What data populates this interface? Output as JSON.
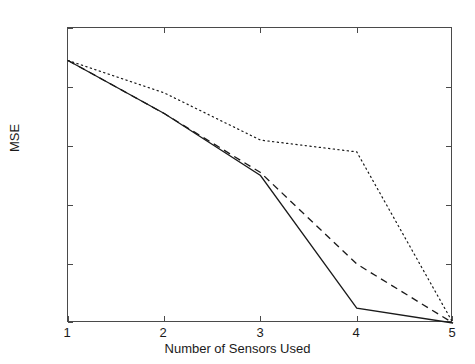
{
  "chart_data": {
    "type": "line",
    "title": "",
    "xlabel": "Number of Sensors Used",
    "ylabel": "MSE",
    "xlim": [
      1,
      5
    ],
    "ylim": [
      1e-10,
      1
    ],
    "yscale": "log",
    "xscale": "linear",
    "grid": false,
    "legend": "none",
    "xticks": [
      1,
      2,
      3,
      4,
      5
    ],
    "xticklabels": [
      "1",
      "2",
      "3",
      "4",
      "5"
    ],
    "yticks": [
      1,
      0.01,
      0.0001,
      1e-06,
      1e-08,
      1e-10
    ],
    "yticklabels": [
      "10<sup>0</sup>",
      "10<sup>-2</sup>",
      "10<sup>-4</sup>",
      "10<sup>-6</sup>",
      "10<sup>-8</sup>",
      "10<sup>-10</sup>"
    ],
    "x": [
      1,
      2,
      3,
      4,
      5
    ],
    "series": [
      {
        "name": "solid",
        "style": "solid",
        "color": "#1a1a1a",
        "values": [
          0.079,
          0.00126,
          1e-05,
          3.2e-10,
          1e-10
        ],
        "log10_values": [
          -1.1,
          -2.9,
          -5.0,
          -9.5,
          -10.0
        ]
      },
      {
        "name": "dashed",
        "style": "dashed",
        "color": "#1a1a1a",
        "values": [
          0.079,
          0.00126,
          1.26e-05,
          1e-08,
          1e-10
        ],
        "log10_values": [
          -1.1,
          -2.9,
          -4.9,
          -8.0,
          -10.0
        ]
      },
      {
        "name": "dotted",
        "style": "dotted",
        "color": "#1a1a1a",
        "values": [
          0.079,
          0.0063,
          0.00016,
          6.3e-05,
          1e-10
        ],
        "log10_values": [
          -1.1,
          -2.2,
          -3.8,
          -4.2,
          -10.0
        ]
      }
    ]
  },
  "axes": {
    "x_title": "Number of Sensors Used",
    "y_title": "MSE"
  },
  "colors": {
    "axis": "#4a4a4a",
    "text": "#1a1a1a",
    "line": "#1a1a1a",
    "background": "#ffffff"
  }
}
